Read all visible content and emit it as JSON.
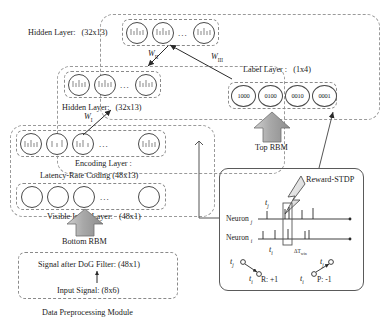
{
  "figure": {
    "caption": "Data Preprocessing Module"
  },
  "network": {
    "top_group_label": "",
    "layers": {
      "hidden2": {
        "name": "Hidden Layer:",
        "size": "(32x13)"
      },
      "hidden1": {
        "name": "Hidden Layer:",
        "size": "(32x13)"
      },
      "encoding": {
        "name": "Encoding Layer :",
        "coding": "Latency-Rate Coding (48x13)"
      },
      "visible": {
        "name": "Visible Input Layer:",
        "size": "(48x1)"
      },
      "label": {
        "name": "Label Layer :",
        "size": "(1x4)"
      }
    },
    "label_nodes": [
      "1000",
      "0100",
      "0010",
      "0001"
    ],
    "weights": {
      "w1": "W",
      "w1_sub": "I",
      "w2": "W",
      "w2_sub": "II",
      "w3": "W",
      "w3_sub": "III"
    },
    "rbm": {
      "top": "Top RBM",
      "bottom": "Bottom RBM"
    },
    "ellipsis": "..."
  },
  "preprocessing": {
    "dog": "Signal after DoG Filter: (48x1)",
    "input": "Input Signal: (8x6)",
    "module": "Data Preprocessing Module"
  },
  "stdp": {
    "title": "Reward-STDP",
    "neuron_j": "Neuron",
    "neuron_j_idx": "j",
    "neuron_i": "Neuron",
    "neuron_i_idx": "i",
    "t_j_top": "t",
    "t_j_top_sub": "j",
    "t_i_axis": "t",
    "t_i_axis_sub": "i",
    "delta_t": "ΔT",
    "delta_t_sub": "win",
    "pair_left": {
      "pre": "t",
      "pre_sub": "j",
      "post": "t",
      "post_sub": "i",
      "result": "R:  +1"
    },
    "pair_right": {
      "pre": "t",
      "pre_sub": "i",
      "post": "t",
      "post_sub": "j",
      "result": "P:  -1"
    }
  },
  "colors": {
    "stroke": "#4a4a4a",
    "dash": "#8a8a8a",
    "arrow_fill": "#9e9e9e",
    "bolt_fill": "#e8e8e8",
    "text": "#1a1a1a"
  }
}
